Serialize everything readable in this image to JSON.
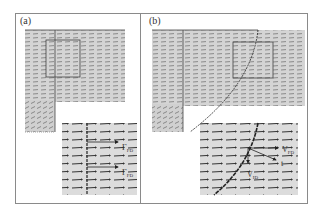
{
  "figure": {
    "panels": [
      {
        "label": "(a)",
        "inset_labels": [
          "Γ_FD",
          "Γ_FD"
        ],
        "description": "Vector field with straight vertical interface and zoom box; inset shows magnified arrows"
      },
      {
        "label": "(b)",
        "inset_labels": [
          "V_FD",
          "V_ID",
          "t"
        ],
        "description": "Vector field with curved interface and zoom box; inset shows magnified arrows with velocity decomposition"
      }
    ]
  },
  "colors": {
    "field_bg": "#d4d4d4",
    "inset_bg": "#dcdcdc",
    "arrow": "#4a4a4a",
    "frame": "#8a8a8a",
    "curve": "#222222"
  }
}
